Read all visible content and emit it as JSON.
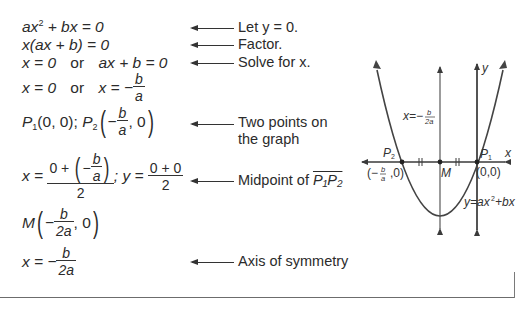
{
  "steps": [
    {
      "expr": "ax² + bx = 0",
      "note": "Let y = 0."
    },
    {
      "expr": "x(ax + b) = 0",
      "note": "Factor."
    },
    {
      "expr": "x = 0   or   ax + b = 0",
      "note": "Solve for x."
    },
    {
      "expr": "x = 0   or   x = −b/a",
      "note": ""
    },
    {
      "expr": "P₁(0, 0); P₂(−b/a, 0)",
      "note": "Two points on the graph"
    },
    {
      "expr": "x = (0 + (−b/a))/2; y = (0 + 0)/2",
      "note": "Midpoint of P₁P₂"
    },
    {
      "expr": "M(−b/(2a), 0)",
      "note": ""
    },
    {
      "expr": "x = −b/(2a)",
      "note": "Axis of symmetry"
    }
  ],
  "labels": {
    "step1_a": "ax",
    "step1_sup": "2",
    "step1_b": " + bx = 0",
    "step2": "x(ax + b) = 0",
    "step3_left": "x = 0",
    "step3_or": "or",
    "step3_right": "ax + b = 0",
    "step4_left": "x = 0",
    "step4_or": "or",
    "step4_right": "x = −",
    "frac_b": "b",
    "frac_a": "a",
    "frac_2a": "2a",
    "p1": "P",
    "p1_sub": "1",
    "p1_coords": "(0, 0); ",
    "p2": "P",
    "p2_sub": "2",
    "minus": "−",
    "comma_zero": ", 0",
    "x_eq": "x = ",
    "zero_plus": "0 + ",
    "two": "2",
    "semi_y": "; y = ",
    "zero_plus_zero": "0 + 0",
    "m": "M",
    "axis_expr": "x = −",
    "note_let_y": "Let y = 0.",
    "note_factor": "Factor.",
    "note_solve": "Solve for x.",
    "note_two_points_1": "Two points on",
    "note_two_points_2": "the graph",
    "note_midpoint": "Midpoint of ",
    "note_midpoint_seg": "P₁P₂",
    "note_axis": "Axis of symmetry"
  },
  "graph": {
    "x_axis_label": "x",
    "y_axis_label": "y",
    "p1_label": "P₁",
    "p2_label": "P₂",
    "m_label": "M",
    "origin_label": "(0,0)",
    "p2_coord_label": "(− b/a ,0)",
    "axis_label": "x=− b/2a",
    "curve_label": "y=ax²+bx",
    "stroke_color": "#3a3a3a"
  }
}
